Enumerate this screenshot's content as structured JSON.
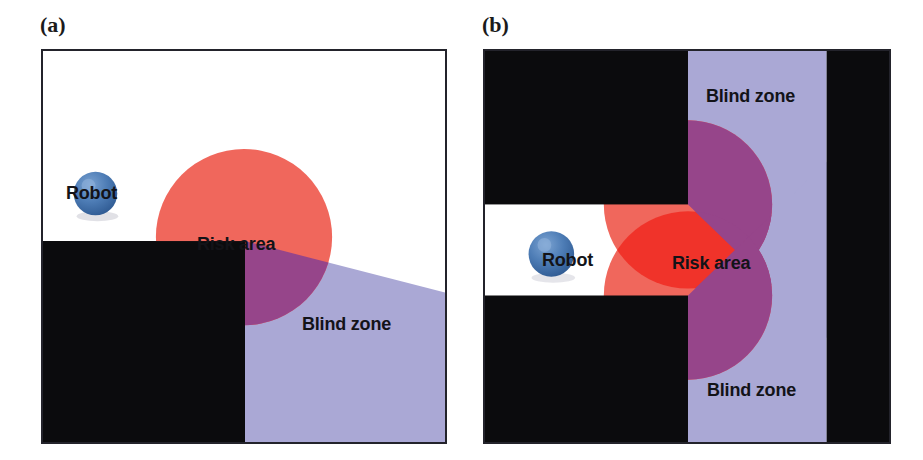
{
  "figure": {
    "panels": [
      {
        "id": "a",
        "label": "(a)",
        "description": "Robot approaching an occluding corner: single sensor cone produces one risk-area disc and a wedge-shaped blind zone behind the obstacle corner.",
        "labels": {
          "robot": "Robot",
          "risk_area": "Risk area",
          "blind_zone": "Blind zone"
        },
        "geometry": {
          "frame": {
            "x": 0,
            "y": 0,
            "w": 406,
            "h": 395
          },
          "obstacle_block": {
            "x": 0,
            "y": 192,
            "w": 204,
            "h": 203
          },
          "blind_zone_polygon": "204,192 406,244 406,395 204,395",
          "risk_circle": {
            "cx": 203,
            "cy": 188,
            "r": 89
          },
          "robot_circle": {
            "cx": 53,
            "cy": 144,
            "r": 22
          }
        }
      },
      {
        "id": "b",
        "label": "(b)",
        "description": "Robot in a corridor between two occluding blocks: two overlapping risk-area discs form a lens, with blind zones above and below the corridor opening.",
        "labels": {
          "robot": "Robot",
          "risk_area": "Risk area",
          "blind_zone_top": "Blind zone",
          "blind_zone_bottom": "Blind zone"
        },
        "geometry": {
          "frame": {
            "x": 0,
            "y": 0,
            "w": 408,
            "h": 395
          },
          "left_block_top": {
            "x": 0,
            "y": 0,
            "w": 205,
            "h": 155
          },
          "left_block_bottom": {
            "x": 0,
            "y": 247,
            "w": 205,
            "h": 148
          },
          "right_block": {
            "x": 345,
            "y": 0,
            "w": 63,
            "h": 395
          },
          "corridor": {
            "x": 0,
            "y": 155,
            "w": 345,
            "h": 92
          },
          "blind_zone_top_polygon": "205,0 345,0 345,290 205,155",
          "blind_zone_bottom_polygon": "205,247 345,112 345,395 205,395",
          "risk_circle_1": {
            "cx": 205,
            "cy": 155,
            "r": 85
          },
          "risk_circle_2": {
            "cx": 205,
            "cy": 247,
            "r": 85
          },
          "robot_circle": {
            "cx": 67,
            "cy": 205,
            "r": 23
          }
        }
      }
    ]
  },
  "palette": {
    "background": "#ffffff",
    "frame_border": "#23232b",
    "obstacle_black": "#0b0b0d",
    "blind_zone_lavender": "#aaa8d5",
    "risk_area_red": "#f0675c",
    "risk_overlap_red": "#f0332a",
    "risk_on_blind_purple": "#96458a",
    "robot_blue": "#4d7cb5",
    "robot_blue_dark": "#2f5a92",
    "robot_blue_light": "#7ba3d2",
    "label_text": "#131318",
    "panel_label_text": "#1b1b1b"
  }
}
